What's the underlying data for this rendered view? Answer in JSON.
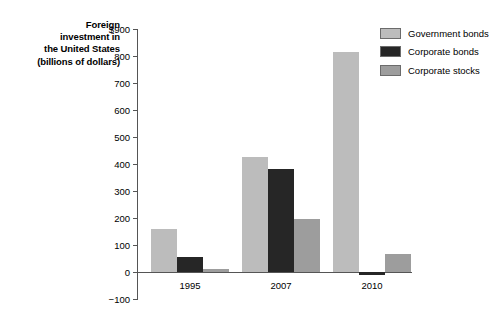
{
  "chart_data": {
    "type": "bar",
    "title": "Foreign investment in the United States (billions of dollars)",
    "title_lines": [
      "Foreign",
      "investment in",
      "the United States",
      "(billions of dollars)"
    ],
    "xlabel": "",
    "ylabel": "Foreign investment in the United States (billions of dollars)",
    "categories": [
      "1995",
      "2007",
      "2010"
    ],
    "series": [
      {
        "name": "Government bonds",
        "color": "#bcbcbc",
        "values": [
          160,
          425,
          815
        ]
      },
      {
        "name": "Corporate bonds",
        "color": "#262626",
        "values": [
          55,
          380,
          -10
        ]
      },
      {
        "name": "Corporate stocks",
        "color": "#9d9d9d",
        "values": [
          10,
          195,
          65
        ]
      }
    ],
    "ylim": [
      -100,
      900
    ],
    "ytick_values": [
      900,
      800,
      700,
      600,
      500,
      400,
      300,
      200,
      100,
      0,
      -100
    ],
    "ytick_labels": [
      "$900",
      "800",
      "700",
      "600",
      "500",
      "400",
      "300",
      "200",
      "100",
      "0",
      "−100"
    ],
    "grid": false,
    "legend_position": "right",
    "axis_color": "#555555"
  },
  "legend": {
    "items": [
      {
        "label": "Government bonds",
        "swatch": "#bcbcbc"
      },
      {
        "label": "Corporate bonds",
        "swatch": "#262626"
      },
      {
        "label": "Corporate stocks",
        "swatch": "#9d9d9d"
      }
    ]
  }
}
